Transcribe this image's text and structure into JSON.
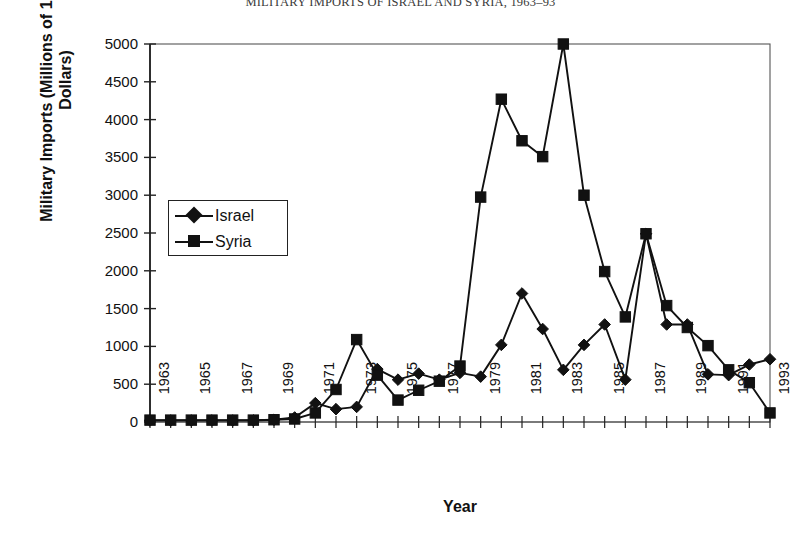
{
  "chart_title": "MILITARY IMPORTS OF ISRAEL AND SYRIA, 1963–93",
  "axes": {
    "ylabel": "Military Imports (Millions of 1993 U.S. Dollars)",
    "xlabel": "Year",
    "ytick_labels": [
      "5000",
      "4500",
      "4000",
      "3500",
      "3000",
      "2500",
      "2000",
      "1500",
      "1000",
      "500",
      "0"
    ],
    "xtick_labels": [
      "1963",
      "1965",
      "1967",
      "1969",
      "1971",
      "1973",
      "1975",
      "1977",
      "1979",
      "1981",
      "1983",
      "1985",
      "1987",
      "1989",
      "1991",
      "1993"
    ]
  },
  "legend": {
    "position": "upper-left-inside",
    "entries": [
      {
        "label": "Israel",
        "marker": "diamond-marker"
      },
      {
        "label": "Syria",
        "marker": "square-marker"
      }
    ]
  },
  "chart_data": {
    "type": "line",
    "title": "MILITARY IMPORTS OF ISRAEL AND SYRIA, 1963–93",
    "xlabel": "Year",
    "ylabel": "Military Imports (Millions of 1993 U.S. Dollars)",
    "xlim": [
      1963,
      1993
    ],
    "ylim": [
      0,
      5000
    ],
    "ytick_step": 500,
    "grid": false,
    "legend_position": "upper left",
    "x": [
      1963,
      1964,
      1965,
      1966,
      1967,
      1968,
      1969,
      1970,
      1971,
      1972,
      1973,
      1974,
      1975,
      1976,
      1977,
      1978,
      1979,
      1980,
      1981,
      1982,
      1983,
      1984,
      1985,
      1986,
      1987,
      1988,
      1989,
      1990,
      1991,
      1992,
      1993
    ],
    "series": [
      {
        "name": "Israel",
        "color": "#111111",
        "marker": "diamond",
        "values": [
          20,
          20,
          20,
          20,
          20,
          20,
          30,
          60,
          250,
          170,
          200,
          700,
          560,
          640,
          560,
          650,
          600,
          1020,
          1700,
          1230,
          690,
          1020,
          1290,
          560,
          2490,
          1290,
          1290,
          630,
          620,
          760,
          830
        ]
      },
      {
        "name": "Syria",
        "color": "#111111",
        "marker": "square",
        "values": [
          25,
          25,
          25,
          25,
          25,
          25,
          30,
          40,
          120,
          430,
          1090,
          620,
          290,
          420,
          540,
          740,
          2975,
          4270,
          3720,
          3510,
          5000,
          3000,
          1990,
          1390,
          2490,
          1540,
          1250,
          1010,
          690,
          520,
          120
        ]
      }
    ]
  },
  "plot_geometry": {
    "left_px": 150,
    "right_px": 770,
    "top_px": 44,
    "bottom_px": 422
  }
}
